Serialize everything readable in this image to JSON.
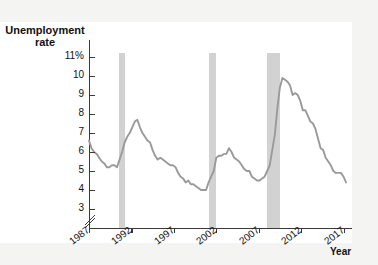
{
  "axis_title": "Unemployment\nrate",
  "x_axis_label": "Year",
  "colors": {
    "line": "#9a9a9a",
    "recession_band": "#d2d2d2",
    "axis": "#3a3a3a",
    "panel_background": "#f4f4f2",
    "plot_background": "#ffffff"
  },
  "chart_data": {
    "type": "line",
    "title": "Unemployment rate",
    "xlabel": "Year",
    "ylabel": "Unemployment rate",
    "xlim": [
      1987,
      2018
    ],
    "ylim": [
      2.6,
      11.4
    ],
    "y_axis_break": true,
    "grid": false,
    "legend": null,
    "ytick_labels": [
      "11%",
      "10",
      "9",
      "8",
      "7",
      "6",
      "5",
      "4",
      "3"
    ],
    "ytick_values": [
      11,
      10,
      9,
      8,
      7,
      6,
      5,
      4,
      3
    ],
    "xtick_labels": [
      "1987",
      "1992",
      "1997",
      "2002",
      "2007",
      "2012",
      "2017"
    ],
    "xtick_values": [
      1987,
      1992,
      1997,
      2002,
      2007,
      2012,
      2017
    ],
    "recession_bands": [
      {
        "label": "1990-91 recession",
        "start": 1990.5,
        "end": 1991.25
      },
      {
        "label": "2001 recession",
        "start": 2001.2,
        "end": 2001.92
      },
      {
        "label": "2007-09 recession",
        "start": 2007.95,
        "end": 2009.5
      }
    ],
    "series": [
      {
        "name": "Unemployment rate",
        "x": [
          1987.0,
          1987.3,
          1987.6,
          1987.9,
          1988.2,
          1988.5,
          1988.8,
          1989.1,
          1989.4,
          1989.7,
          1990.0,
          1990.3,
          1990.6,
          1990.9,
          1991.2,
          1991.5,
          1991.8,
          1992.1,
          1992.4,
          1992.7,
          1993.0,
          1993.3,
          1993.6,
          1993.9,
          1994.2,
          1994.5,
          1994.8,
          1995.1,
          1995.4,
          1995.7,
          1996.0,
          1996.3,
          1996.6,
          1996.9,
          1997.2,
          1997.5,
          1997.8,
          1998.1,
          1998.4,
          1998.7,
          1999.0,
          1999.3,
          1999.6,
          1999.9,
          2000.2,
          2000.5,
          2000.8,
          2001.1,
          2001.4,
          2001.7,
          2002.0,
          2002.3,
          2002.6,
          2002.9,
          2003.2,
          2003.5,
          2003.8,
          2004.1,
          2004.4,
          2004.7,
          2005.0,
          2005.3,
          2005.6,
          2005.9,
          2006.2,
          2006.5,
          2006.8,
          2007.1,
          2007.4,
          2007.7,
          2008.0,
          2008.3,
          2008.6,
          2008.9,
          2009.2,
          2009.5,
          2009.8,
          2010.1,
          2010.4,
          2010.7,
          2011.0,
          2011.3,
          2011.6,
          2011.9,
          2012.2,
          2012.5,
          2012.8,
          2013.1,
          2013.4,
          2013.7,
          2014.0,
          2014.3,
          2014.6,
          2014.9,
          2015.2,
          2015.5,
          2015.8,
          2016.1,
          2016.4,
          2016.7,
          2017.0,
          2017.3
        ],
        "y": [
          6.6,
          6.2,
          6.0,
          5.9,
          5.7,
          5.5,
          5.4,
          5.2,
          5.2,
          5.3,
          5.3,
          5.2,
          5.6,
          6.0,
          6.5,
          6.8,
          7.0,
          7.3,
          7.6,
          7.7,
          7.3,
          7.0,
          6.8,
          6.6,
          6.5,
          6.1,
          5.8,
          5.6,
          5.7,
          5.6,
          5.5,
          5.4,
          5.3,
          5.3,
          5.2,
          4.9,
          4.7,
          4.6,
          4.4,
          4.5,
          4.3,
          4.3,
          4.2,
          4.1,
          4.0,
          4.0,
          4.0,
          4.4,
          4.7,
          5.0,
          5.7,
          5.8,
          5.8,
          5.9,
          5.9,
          6.2,
          6.0,
          5.7,
          5.6,
          5.5,
          5.3,
          5.1,
          5.0,
          5.0,
          4.7,
          4.6,
          4.5,
          4.5,
          4.6,
          4.7,
          5.0,
          5.3,
          6.1,
          6.9,
          8.3,
          9.4,
          9.9,
          9.8,
          9.7,
          9.5,
          9.0,
          9.1,
          9.0,
          8.7,
          8.2,
          8.2,
          7.9,
          7.6,
          7.5,
          7.2,
          6.7,
          6.2,
          6.1,
          5.7,
          5.5,
          5.3,
          5.0,
          4.9,
          4.9,
          4.9,
          4.7,
          4.4
        ]
      }
    ]
  }
}
